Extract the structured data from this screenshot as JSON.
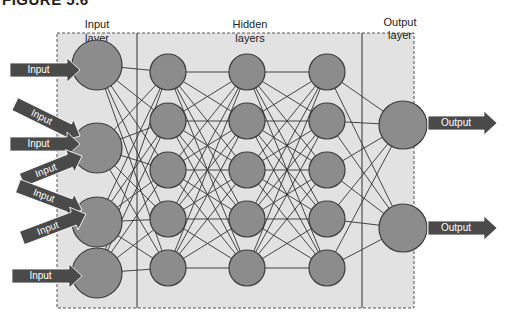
{
  "figure": {
    "caption_partial": "FIGURE 5.6",
    "colors": {
      "panel": "#e2e2e2",
      "node_fill": "#8c8c8c",
      "node_stroke": "#3c3c3c",
      "edge": "#333333",
      "arrow": "#4a4a4a",
      "arrow_text": "#ffffff"
    }
  },
  "layers": {
    "input": {
      "title_line1": "Input",
      "title_line2": "layer",
      "nodes": 4
    },
    "hidden": {
      "title_line1": "Hidden",
      "title_line2": "layers",
      "count": 3,
      "nodes_per_layer": 5
    },
    "output": {
      "title_line1": "Output",
      "title_line2": "layer",
      "nodes": 2
    }
  },
  "arrows": {
    "inputs": [
      "Input",
      "Input",
      "Input",
      "Input",
      "Input",
      "Input",
      "Input"
    ],
    "outputs": [
      "Output",
      "Output"
    ]
  }
}
